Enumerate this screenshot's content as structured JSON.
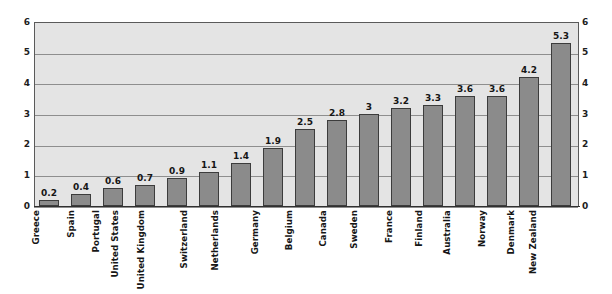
{
  "chart_data": {
    "type": "bar",
    "title": "",
    "subtitle": "",
    "xlabel": "",
    "ylabel": "",
    "ylim": [
      0,
      6
    ],
    "y_ticks": [
      0,
      1,
      2,
      3,
      4,
      5,
      6
    ],
    "grid": true,
    "legend": null,
    "dual_axis": true,
    "axis_left_ticks": [
      "6",
      "5",
      "4",
      "3",
      "2",
      "1",
      "0"
    ],
    "axis_right_ticks": [
      "6",
      "5",
      "4",
      "3",
      "2",
      "1",
      "0"
    ],
    "categories": [
      "Greece",
      "Spain",
      "Portugal",
      "United States",
      "United Kingdom",
      "Switzerland",
      "Netherlands",
      "Germany",
      "Belgium",
      "Canada",
      "Sweden",
      "France",
      "Finland",
      "Australia",
      "Norway",
      "Denmark",
      "New Zealand"
    ],
    "values": [
      0.2,
      0.4,
      0.6,
      0.7,
      0.9,
      1.1,
      1.4,
      1.9,
      2.5,
      2.8,
      3,
      3.2,
      3.3,
      3.6,
      3.6,
      4.2,
      5.3
    ],
    "value_labels": [
      "0.2",
      "0.4",
      "0.6",
      "0.7",
      "0.9",
      "1.1",
      "1.4",
      "1.9",
      "2.5",
      "2.8",
      "3",
      "3.2",
      "3.3",
      "3.6",
      "3.6",
      "4.2",
      "5.3"
    ],
    "colors": {
      "bar_fill": "#8b8b8b",
      "bar_border": "#3c3c3c",
      "plot_background": "#e4e4e4",
      "gridline": "#8e8e8e",
      "axis": "#303030",
      "text": "#151515",
      "page_background": "#ffffff"
    }
  }
}
